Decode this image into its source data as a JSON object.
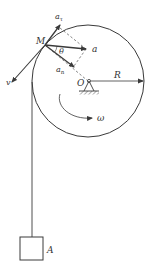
{
  "diagram": {
    "type": "pulley-kinematics",
    "colors": {
      "stroke": "#3a3a3a",
      "text": "#333333",
      "background": "#ffffff"
    },
    "labels": {
      "point_M": "M",
      "a_tau": "a",
      "a_tau_sub": "τ",
      "a_total": "a",
      "theta": "θ",
      "a_n": "a",
      "a_n_sub": "n",
      "velocity": "v",
      "center": "O",
      "radius": "R",
      "omega": "ω",
      "block": "A"
    },
    "geometry": {
      "circle": {
        "cx": 88,
        "cy": 81,
        "r": 56
      },
      "point_M": {
        "x": 45,
        "y": 45
      },
      "block": {
        "x": 20,
        "y": 237,
        "w": 23,
        "h": 23
      },
      "rope_x": 32
    }
  }
}
